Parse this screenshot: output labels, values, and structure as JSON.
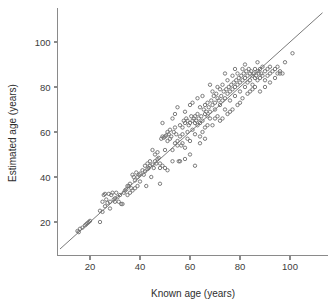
{
  "chart_data": {
    "type": "scatter",
    "title": "",
    "subtitle": "",
    "xlabel": "Known age (years)",
    "ylabel": "Estimated age (years)",
    "xlim": [
      8,
      116
    ],
    "ylim": [
      5,
      118
    ],
    "xticks": [
      20,
      40,
      60,
      80,
      100
    ],
    "yticks": [
      20,
      40,
      60,
      80,
      100
    ],
    "xtick_labels": [
      "20",
      "40",
      "60",
      "80",
      "100"
    ],
    "ytick_labels": [
      "20",
      "40",
      "60",
      "80",
      "100"
    ],
    "grid": false,
    "legend": "none",
    "marker": "open-circle",
    "marker_color": "#6f6f6f",
    "marker_size": 3.4,
    "reference_line": {
      "name": "identity-line",
      "type": "line",
      "slope": 1,
      "intercept": 0,
      "color": "#7a7a7a",
      "x_from": 8,
      "x_to": 113,
      "y_from": 8,
      "y_to": 113
    },
    "n_points": 248,
    "points": [
      [
        15,
        16
      ],
      [
        15.5,
        15.5
      ],
      [
        16,
        17
      ],
      [
        17,
        17.5
      ],
      [
        18,
        18.5
      ],
      [
        18.5,
        19
      ],
      [
        19,
        19.5
      ],
      [
        19.5,
        20
      ],
      [
        20,
        20.5
      ],
      [
        24,
        20
      ],
      [
        25,
        24.5
      ],
      [
        25,
        29
      ],
      [
        25.5,
        32
      ],
      [
        26,
        32.5
      ],
      [
        26.5,
        30
      ],
      [
        27,
        28.5
      ],
      [
        27.5,
        32.5
      ],
      [
        28,
        29
      ],
      [
        28.5,
        32
      ],
      [
        29,
        33
      ],
      [
        29.5,
        30
      ],
      [
        30,
        30.5
      ],
      [
        30.5,
        33
      ],
      [
        31,
        31
      ],
      [
        31.5,
        29
      ],
      [
        32,
        32
      ],
      [
        32.5,
        28
      ],
      [
        33,
        28
      ],
      [
        33.5,
        33
      ],
      [
        34,
        34
      ],
      [
        34.5,
        34.5
      ],
      [
        35,
        36
      ],
      [
        35.5,
        36
      ],
      [
        36,
        37
      ],
      [
        36.5,
        35
      ],
      [
        37,
        41
      ],
      [
        37.5,
        40
      ],
      [
        38,
        38.5
      ],
      [
        38.5,
        42
      ],
      [
        39,
        40
      ],
      [
        39.5,
        41
      ],
      [
        40,
        41.5
      ],
      [
        40,
        38
      ],
      [
        41,
        43
      ],
      [
        41.5,
        41
      ],
      [
        42,
        42.5
      ],
      [
        42.5,
        36
      ],
      [
        43,
        43.5
      ],
      [
        43.5,
        44
      ],
      [
        44,
        45
      ],
      [
        44.5,
        40
      ],
      [
        45,
        45.5
      ],
      [
        45.5,
        44
      ],
      [
        46,
        47
      ],
      [
        46.5,
        46
      ],
      [
        47,
        48
      ],
      [
        47.5,
        48.5
      ],
      [
        48,
        46
      ],
      [
        48,
        37
      ],
      [
        48.5,
        57
      ],
      [
        49,
        58
      ],
      [
        49,
        64
      ],
      [
        49.5,
        57.5
      ],
      [
        50,
        58
      ],
      [
        50,
        52
      ],
      [
        50.5,
        58.5
      ],
      [
        51,
        56
      ],
      [
        51,
        60
      ],
      [
        51.5,
        59
      ],
      [
        52,
        57
      ],
      [
        52,
        61
      ],
      [
        52.5,
        58
      ],
      [
        53,
        47
      ],
      [
        53,
        52
      ],
      [
        53.5,
        60
      ],
      [
        54,
        55
      ],
      [
        54,
        62
      ],
      [
        54.5,
        59
      ],
      [
        55,
        54
      ],
      [
        55,
        56
      ],
      [
        55.5,
        47
      ],
      [
        56,
        47
      ],
      [
        56,
        58
      ],
      [
        56.5,
        54
      ],
      [
        57,
        55
      ],
      [
        57,
        62
      ],
      [
        57.5,
        65
      ],
      [
        58,
        64
      ],
      [
        58,
        53
      ],
      [
        58.5,
        66
      ],
      [
        59,
        65
      ],
      [
        59,
        60
      ],
      [
        59.5,
        63
      ],
      [
        60,
        64
      ],
      [
        60,
        56
      ],
      [
        60.5,
        67
      ],
      [
        61,
        65
      ],
      [
        61,
        61
      ],
      [
        61.5,
        66
      ],
      [
        62,
        64
      ],
      [
        62,
        67
      ],
      [
        62.5,
        65
      ],
      [
        63,
        63
      ],
      [
        63,
        68
      ],
      [
        63.5,
        66
      ],
      [
        64,
        64
      ],
      [
        64,
        71
      ],
      [
        64.5,
        67
      ],
      [
        65,
        65
      ],
      [
        65,
        60
      ],
      [
        65.5,
        70
      ],
      [
        66,
        68
      ],
      [
        66,
        72
      ],
      [
        66.5,
        69
      ],
      [
        67,
        67
      ],
      [
        67,
        73
      ],
      [
        67.5,
        71
      ],
      [
        68,
        69
      ],
      [
        68,
        66
      ],
      [
        68.5,
        74
      ],
      [
        69,
        72
      ],
      [
        69,
        78
      ],
      [
        69.5,
        76
      ],
      [
        70,
        73
      ],
      [
        70,
        70
      ],
      [
        70.5,
        77
      ],
      [
        71,
        75
      ],
      [
        71,
        80
      ],
      [
        71.5,
        74
      ],
      [
        72,
        72
      ],
      [
        72,
        79
      ],
      [
        72.5,
        76
      ],
      [
        73,
        74
      ],
      [
        73,
        81
      ],
      [
        73.5,
        78
      ],
      [
        74,
        75
      ],
      [
        74,
        70
      ],
      [
        74.5,
        79
      ],
      [
        75,
        77
      ],
      [
        75,
        83
      ],
      [
        75.5,
        80
      ],
      [
        76,
        78
      ],
      [
        76,
        74
      ],
      [
        76.5,
        81
      ],
      [
        77,
        79
      ],
      [
        77,
        85
      ],
      [
        77.5,
        82
      ],
      [
        78,
        80
      ],
      [
        78,
        76
      ],
      [
        78.5,
        83
      ],
      [
        79,
        81
      ],
      [
        79,
        86
      ],
      [
        79.5,
        84
      ],
      [
        80,
        82
      ],
      [
        80,
        78
      ],
      [
        80.5,
        85
      ],
      [
        81,
        83
      ],
      [
        81,
        88
      ],
      [
        81.5,
        86
      ],
      [
        82,
        84
      ],
      [
        82,
        80
      ],
      [
        82.5,
        87
      ],
      [
        83,
        85
      ],
      [
        83,
        82
      ],
      [
        83.5,
        88
      ],
      [
        84,
        86
      ],
      [
        84,
        83
      ],
      [
        84.5,
        87
      ],
      [
        85,
        85
      ],
      [
        85,
        81
      ],
      [
        85.5,
        86
      ],
      [
        86,
        84
      ],
      [
        86,
        88
      ],
      [
        86.5,
        85
      ],
      [
        87,
        83
      ],
      [
        87,
        87
      ],
      [
        87.5,
        86
      ],
      [
        88,
        84
      ],
      [
        88,
        88
      ],
      [
        88.5,
        86
      ],
      [
        89,
        85
      ],
      [
        89,
        89
      ],
      [
        90,
        87
      ],
      [
        90,
        83
      ],
      [
        91,
        88
      ],
      [
        91,
        85
      ],
      [
        92,
        86
      ],
      [
        92,
        89
      ],
      [
        93,
        87
      ],
      [
        94,
        88
      ],
      [
        95,
        89
      ],
      [
        95,
        86
      ],
      [
        96,
        87
      ],
      [
        97,
        86
      ],
      [
        98,
        91
      ],
      [
        101,
        95
      ],
      [
        45,
        52
      ],
      [
        46,
        50
      ],
      [
        47,
        51
      ],
      [
        48,
        44
      ],
      [
        49,
        45
      ],
      [
        50,
        44
      ],
      [
        51,
        43
      ],
      [
        44,
        47
      ],
      [
        43,
        46
      ],
      [
        42,
        45
      ],
      [
        53,
        66
      ],
      [
        54,
        68
      ],
      [
        55,
        71
      ],
      [
        56,
        63
      ],
      [
        57,
        59
      ],
      [
        58,
        69
      ],
      [
        59,
        57
      ],
      [
        60,
        72
      ],
      [
        61,
        73
      ],
      [
        62,
        59
      ],
      [
        63,
        75
      ],
      [
        64,
        58
      ],
      [
        65,
        76
      ],
      [
        66,
        62
      ],
      [
        67,
        63
      ],
      [
        68,
        81
      ],
      [
        69,
        63
      ],
      [
        70,
        66
      ],
      [
        71,
        67
      ],
      [
        72,
        65
      ],
      [
        73,
        66
      ],
      [
        74,
        86
      ],
      [
        75,
        68
      ],
      [
        76,
        69
      ],
      [
        77,
        70
      ],
      [
        78,
        88
      ],
      [
        79,
        72
      ],
      [
        80,
        73
      ],
      [
        81,
        75
      ],
      [
        82,
        90
      ],
      [
        83,
        77
      ],
      [
        84,
        78
      ],
      [
        85,
        79
      ],
      [
        86,
        80
      ],
      [
        87,
        91
      ],
      [
        35,
        32
      ],
      [
        36,
        33
      ],
      [
        37,
        34
      ],
      [
        38,
        35
      ],
      [
        39,
        36
      ],
      [
        62,
        45
      ],
      [
        64,
        55
      ],
      [
        66,
        57
      ],
      [
        58,
        48
      ],
      [
        60,
        50
      ],
      [
        88,
        78
      ],
      [
        90,
        80
      ],
      [
        92,
        82
      ],
      [
        94,
        84
      ],
      [
        96,
        86
      ],
      [
        24,
        25
      ],
      [
        26,
        27
      ],
      [
        28,
        26
      ],
      [
        30,
        29
      ]
    ]
  }
}
